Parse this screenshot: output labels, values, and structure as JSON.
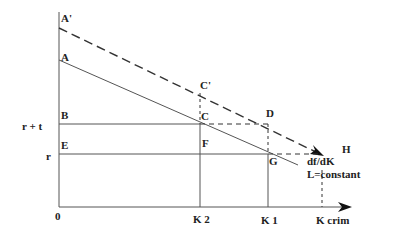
{
  "diagram": {
    "points": {
      "a_prime": "A'",
      "a": "A",
      "b": "B",
      "e": "E",
      "c_prime": "C'",
      "c": "C",
      "d": "D",
      "f": "F",
      "g": "G",
      "h": "H"
    },
    "y_axis_labels": {
      "r_plus_t": "r + t",
      "r": "r"
    },
    "x_axis_labels": {
      "origin": "0",
      "k2": "K 2",
      "k1": "K 1",
      "kcrim": "K crim"
    },
    "annotations": {
      "derivative": "df/dK",
      "constraint": "L=constant"
    }
  }
}
